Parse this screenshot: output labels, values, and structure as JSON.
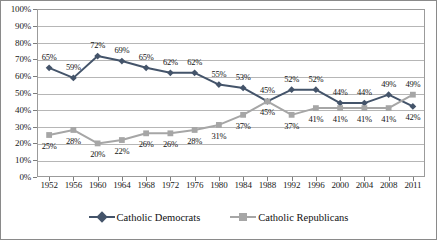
{
  "chart_data": {
    "type": "line",
    "title": "",
    "xlabel": "",
    "ylabel": "",
    "ylim": [
      0,
      100
    ],
    "ytick_labels": [
      "0%",
      "10%",
      "20%",
      "30%",
      "40%",
      "50%",
      "60%",
      "70%",
      "80%",
      "90%",
      "100%"
    ],
    "ytick_values": [
      0,
      10,
      20,
      30,
      40,
      50,
      60,
      70,
      80,
      90,
      100
    ],
    "grid": "horizontal",
    "legend_position": "bottom",
    "categories": [
      "1952",
      "1956",
      "1960",
      "1964",
      "1968",
      "1972",
      "1976",
      "1980",
      "1984",
      "1988",
      "1992",
      "1996",
      "2000",
      "2004",
      "2008",
      "2011"
    ],
    "series": [
      {
        "name": "Catholic Democrats",
        "color": "#44546a",
        "marker": "diamond",
        "values": [
          65,
          59,
          72,
          69,
          65,
          62,
          62,
          55,
          53,
          45,
          52,
          52,
          44,
          44,
          49,
          42
        ],
        "labels": [
          "65%",
          "59%",
          "72%",
          "69%",
          "65%",
          "62%",
          "62%",
          "55%",
          "53%",
          "45%",
          "52%",
          "52%",
          "44%",
          "44%",
          "49%",
          "42%"
        ]
      },
      {
        "name": "Catholic Republicans",
        "color": "#a6a6a6",
        "marker": "square",
        "values": [
          25,
          28,
          20,
          22,
          26,
          26,
          28,
          31,
          37,
          45,
          37,
          41,
          41,
          41,
          41,
          49
        ],
        "labels": [
          "25%",
          "28%",
          "20%",
          "22%",
          "26%",
          "26%",
          "28%",
          "31%",
          "37%",
          "45%",
          "37%",
          "41%",
          "41%",
          "41%",
          "41%",
          "49%"
        ]
      }
    ]
  }
}
